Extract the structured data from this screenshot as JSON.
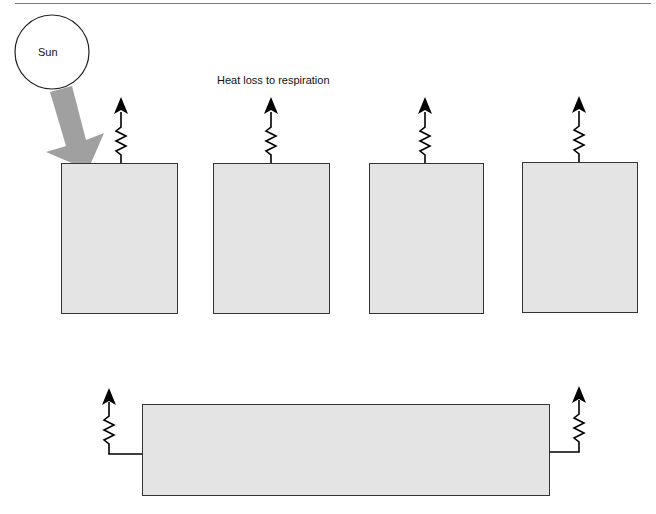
{
  "diagram": {
    "sun": {
      "label": "Sun"
    },
    "annotation": {
      "heat_loss_label": "Heat loss to respiration"
    },
    "trophic_boxes": [
      {
        "id": "box-1",
        "label": ""
      },
      {
        "id": "box-2",
        "label": ""
      },
      {
        "id": "box-3",
        "label": ""
      },
      {
        "id": "box-4",
        "label": ""
      }
    ],
    "decomposer_box": {
      "label": ""
    },
    "colors": {
      "box_fill": "#e4e4e4",
      "box_border": "#333333",
      "sun_arrow": "#a0a0a0",
      "heat_arrow": "#000000"
    }
  }
}
